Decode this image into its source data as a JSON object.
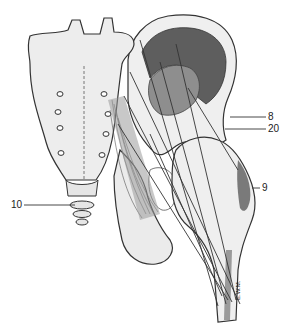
{
  "figure": {
    "colors": {
      "background": "#ffffff",
      "bone_fill": "#eeeeee",
      "bone_shade": "#d6d6d6",
      "outline": "#333333",
      "muscle_dark": "#5a5a5a",
      "muscle_mid": "#8c8c8c",
      "leader_line": "#333333"
    },
    "signature": "E.W.M.",
    "labels": [
      {
        "id": "8",
        "text": "8",
        "x": 268,
        "y": 113,
        "line_from": [
          230,
          117
        ],
        "line_to": [
          266,
          117
        ]
      },
      {
        "id": "20",
        "text": "20",
        "x": 268,
        "y": 125,
        "line_from": [
          225,
          129
        ],
        "line_to": [
          266,
          129
        ]
      },
      {
        "id": "9",
        "text": "9",
        "x": 262,
        "y": 183,
        "line_from": [
          254,
          188
        ],
        "line_to": [
          260,
          188
        ]
      },
      {
        "id": "10",
        "text": "10",
        "x": 10,
        "y": 200,
        "line_from": [
          24,
          205
        ],
        "line_to": [
          75,
          205
        ]
      }
    ]
  }
}
